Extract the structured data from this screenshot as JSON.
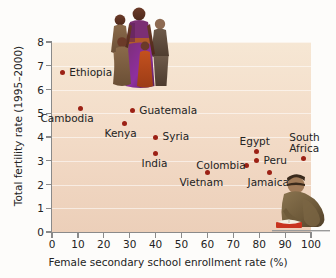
{
  "chart_data": {
    "type": "scatter",
    "title": "",
    "xlabel": "Female secondary school enrollment rate (%)",
    "ylabel": "Total fertility rate (1995–2000)",
    "xlim": [
      0,
      100
    ],
    "ylim": [
      0,
      8
    ],
    "xticks": [
      "0",
      "10",
      "20",
      "30",
      "40",
      "50",
      "60",
      "70",
      "80",
      "90",
      "100"
    ],
    "yticks": [
      "0",
      "1",
      "2",
      "3",
      "4",
      "5",
      "6",
      "7",
      "8"
    ],
    "grid": true,
    "legend": "none",
    "marker_color": "#9c2115",
    "plot_bg_top": "#f6e7d4",
    "plot_bg_bottom": "#eccfb9",
    "points": [
      {
        "label": "Ethiopia",
        "x": 4,
        "y": 6.7,
        "label_dx": 7,
        "label_dy": -6
      },
      {
        "label": "Cambodia",
        "x": 11,
        "y": 5.2,
        "label_dx": -40,
        "label_dy": 4
      },
      {
        "label": "Kenya",
        "x": 28,
        "y": 4.55,
        "label_dx": -20,
        "label_dy": 4
      },
      {
        "label": "Guatemala",
        "x": 31,
        "y": 5.1,
        "label_dx": 7,
        "label_dy": -6
      },
      {
        "label": "Syria",
        "x": 40,
        "y": 4.0,
        "label_dx": 7,
        "label_dy": -6
      },
      {
        "label": "India",
        "x": 40,
        "y": 3.3,
        "label_dx": -14,
        "label_dy": 4
      },
      {
        "label": "Vietnam",
        "x": 60,
        "y": 2.5,
        "label_dx": -28,
        "label_dy": 4
      },
      {
        "label": "Colombia",
        "x": 75,
        "y": 2.8,
        "label_dx": -50,
        "label_dy": -6
      },
      {
        "label": "Egypt",
        "x": 79,
        "y": 3.4,
        "label_dx": -17,
        "label_dy": -15
      },
      {
        "label": "Peru",
        "x": 79,
        "y": 3.0,
        "label_dx": 7,
        "label_dy": -6
      },
      {
        "label": "Jamaica",
        "x": 84,
        "y": 2.5,
        "label_dx": -22,
        "label_dy": 4
      },
      {
        "label": "South\nAfrica",
        "x": 97,
        "y": 3.1,
        "label_dx": -14,
        "label_dy": -26
      }
    ]
  },
  "images": {
    "family_photo_alt": "family-photo",
    "reader_photo_alt": "person-reading-book-photo"
  }
}
